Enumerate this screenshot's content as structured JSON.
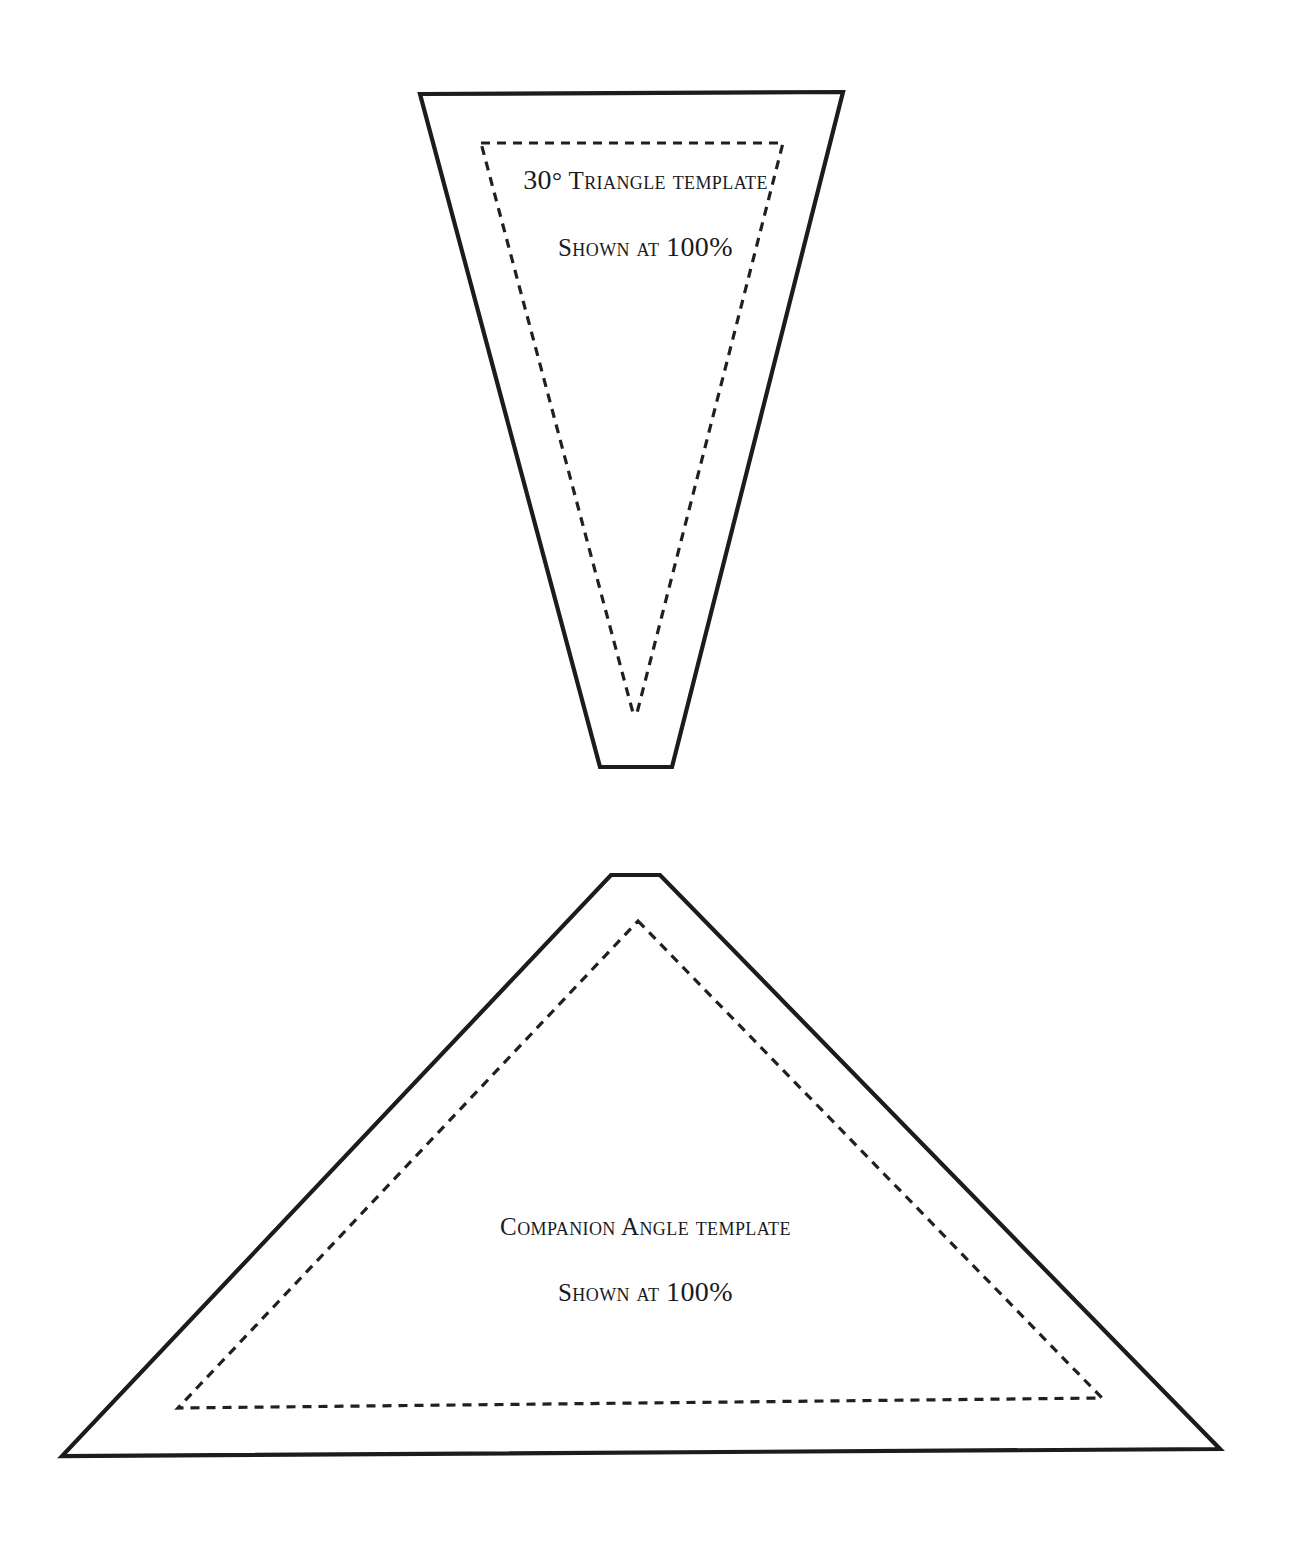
{
  "page": {
    "background_color": "#ffffff",
    "ink_color": "#1b1b20",
    "text_color": "#1a1a22",
    "width": 1291,
    "height": 1541
  },
  "templates": [
    {
      "id": "thirty-degree-triangle",
      "name": "30 Degree Triangle Template",
      "title_prefix": "30",
      "degree_symbol": "°",
      "title_rest": "Triangle template",
      "scale_prefix": "Shown at",
      "scale_value": "100%",
      "cut_line_style": "solid",
      "seam_line_style": "dashed",
      "outline_points": "420,94 843,92 672,767 600,767",
      "seam_points": "481,143 783,143 637,713 633,713"
    },
    {
      "id": "companion-angle-triangle",
      "name": "Companion Angle Template",
      "title_prefix": "",
      "degree_symbol": "",
      "title_rest": "Companion Angle template",
      "scale_prefix": "Shown at",
      "scale_value": "100%",
      "cut_line_style": "solid",
      "seam_line_style": "dashed",
      "outline_points": "611,875 660,875 1220,1449 62,1456",
      "seam_points": "638,921 1102,1398 178,1408"
    }
  ]
}
